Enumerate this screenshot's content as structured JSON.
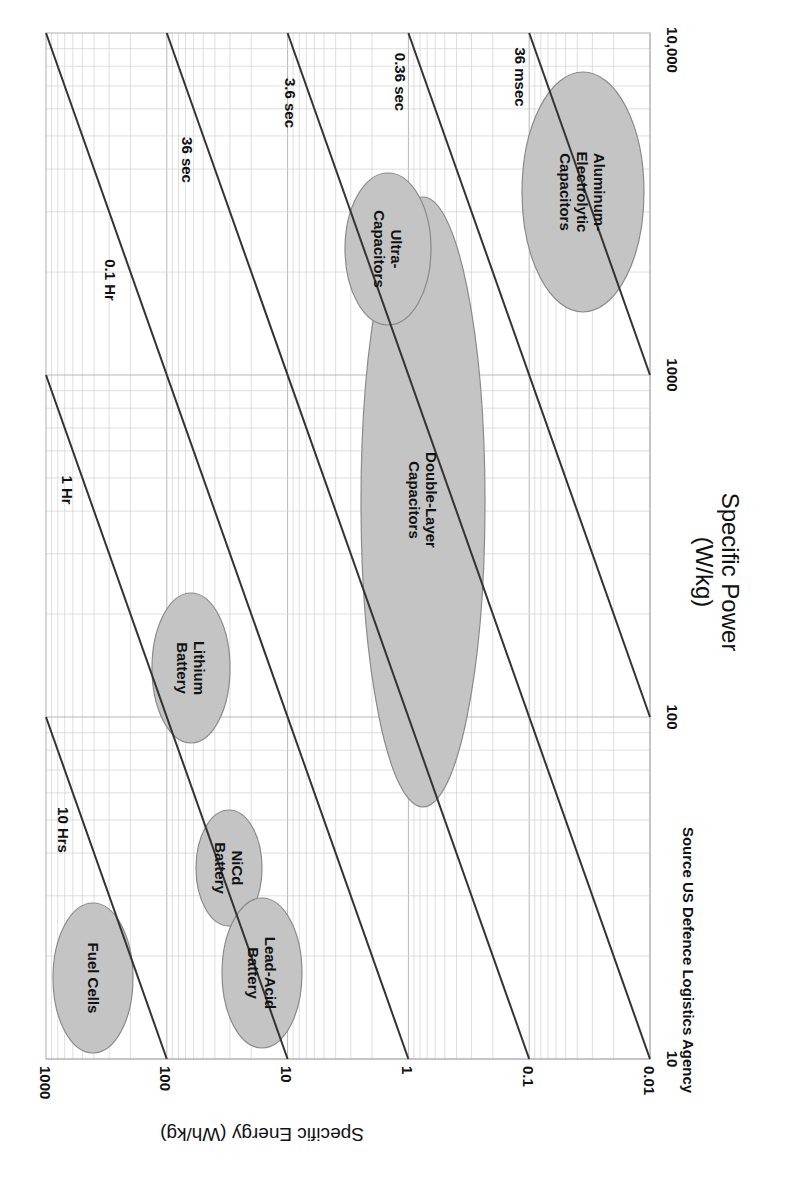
{
  "chart_data": {
    "type": "scatter",
    "subtype": "ragone-plot (log-log, regions as ellipses, image rotated 90 degrees)",
    "title": "",
    "xlabel": "Specific Power (W/kg)",
    "ylabel": "Specific Energy (Wh/kg)",
    "xscale": "log",
    "yscale": "log",
    "xlim": [
      10,
      10000
    ],
    "ylim": [
      0.01,
      1000
    ],
    "x_ticks": [
      "10",
      "100",
      "1000",
      "10,000"
    ],
    "y_ticks": [
      "1000",
      "100",
      "10",
      "1",
      "0.1",
      "0.01"
    ],
    "grid": true,
    "source_note": "Source US Defence Logistics Agency",
    "constant_time_lines": [
      {
        "label": "10 Hrs",
        "hours": 10
      },
      {
        "label": "1 Hr",
        "hours": 1
      },
      {
        "label": "0.1 Hr",
        "hours": 0.1
      },
      {
        "label": "36 sec",
        "hours": 0.01
      },
      {
        "label": "3.6 sec",
        "hours": 0.001
      },
      {
        "label": "0.36 sec",
        "hours": 0.0001
      },
      {
        "label": "36 msec",
        "hours": 1e-05
      }
    ],
    "regions": [
      {
        "name": "Fuel Cells",
        "power_range_wkg": [
          14,
          40
        ],
        "energy_range_whkg": [
          150,
          850
        ]
      },
      {
        "name": "Lead-Acid Battery",
        "power_range_wkg": [
          14,
          40
        ],
        "energy_range_whkg": [
          10,
          50
        ]
      },
      {
        "name": "NiCd Battery",
        "power_range_wkg": [
          37,
          80
        ],
        "energy_range_whkg": [
          17,
          60
        ]
      },
      {
        "name": "Lithium Battery",
        "power_range_wkg": [
          90,
          250
        ],
        "energy_range_whkg": [
          30,
          150
        ]
      },
      {
        "name": "Double-Layer Capacitors",
        "power_range_wkg": [
          70,
          2300
        ],
        "energy_range_whkg": [
          0.05,
          5.5
        ]
      },
      {
        "name": "Ultra-Capacitors",
        "power_range_wkg": [
          1300,
          3700
        ],
        "energy_range_whkg": [
          1.1,
          6
        ]
      },
      {
        "name": "Aluminum-Electrolytic Capacitors",
        "power_range_wkg": [
          1400,
          7000
        ],
        "energy_range_whkg": [
          0.01,
          0.1
        ]
      }
    ]
  },
  "labels": {
    "x_axis_title_line1": "Specific Power",
    "x_axis_title_line2": "(W/kg)",
    "y_axis_title": "Specific Energy (Wh/kg)",
    "source": "Source US Defence Logistics Agency",
    "x_ticks": [
      "10",
      "100",
      "1000",
      "10,000"
    ],
    "y_ticks": [
      "1000",
      "100",
      "10",
      "1",
      "0.1",
      "0.01"
    ],
    "lines": [
      "10 Hrs",
      "1 Hr",
      "0.1 Hr",
      "36 sec",
      "3.6 sec",
      "0.36 sec",
      "36 msec"
    ],
    "regions": {
      "fuel_cells": [
        "Fuel Cells"
      ],
      "lead_acid": [
        "Lead-Acid",
        "Battery"
      ],
      "nicd": [
        "NiCd",
        "Battery"
      ],
      "lithium": [
        "Lithium",
        "Battery"
      ],
      "double_layer": [
        "Double-Layer",
        "Capacitors"
      ],
      "ultra": [
        "Ultra-",
        "Capacitors"
      ],
      "aluminum": [
        "Aluminum-",
        "Electrolytic",
        "Capacitors"
      ]
    }
  },
  "colors": {
    "region_fill": "#c4c4c4",
    "region_stroke": "#8a8a8a",
    "line": "#333333",
    "grid": "#c8c8c8"
  }
}
